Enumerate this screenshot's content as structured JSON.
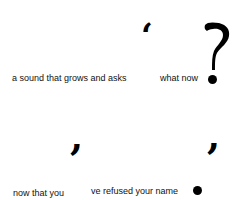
{
  "poem": {
    "line1": {
      "left_text": "a sound that grows and asks",
      "right_text": "what now",
      "open_quote": "‘",
      "question_mark": "?"
    },
    "line2": {
      "left_text": "now that you",
      "right_text": "ve refused your name",
      "comma_left": ",",
      "comma_right": ","
    }
  },
  "colors": {
    "text": "#111111",
    "ink": "#000000",
    "background": "#ffffff"
  }
}
